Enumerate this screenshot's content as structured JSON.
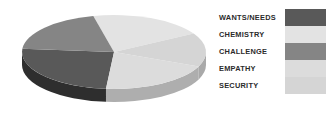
{
  "chart_data": {
    "type": "pie",
    "title": "",
    "subtitle": "",
    "xlabel": "",
    "ylabel": "",
    "legend_position": "right",
    "grid": false,
    "three_d": true,
    "background_color": "#ffffff",
    "categories": [
      "WANTS/NEEDS",
      "CHEMISTRY",
      "CHALLENGE",
      "EMPATHY",
      "SECURITY"
    ],
    "values": [
      25,
      20,
      20,
      20,
      15
    ],
    "colors": [
      "#595959",
      "#e3e3e3",
      "#858585",
      "#dcdcdc",
      "#d5d5d5"
    ],
    "side_colors": [
      "#2e2e2e",
      "#b4b4b4",
      "#5f5f5f",
      "#aeaeae",
      "#a9a9a9"
    ],
    "slices": [
      {
        "label": "WANTS/NEEDS",
        "value": 25,
        "color": "#595959",
        "side_color": "#2e2e2e",
        "start_angle": 95,
        "end_angle": 185
      },
      {
        "label": "CHEMISTRY",
        "value": 20,
        "color": "#e3e3e3",
        "side_color": "#b4b4b4",
        "start_angle": 257,
        "end_angle": 330
      },
      {
        "label": "CHALLENGE",
        "value": 20,
        "color": "#858585",
        "side_color": "#5f5f5f",
        "start_angle": 185,
        "end_angle": 257
      },
      {
        "label": "EMPATHY",
        "value": 20,
        "color": "#dcdcdc",
        "side_color": "#aeaeae",
        "start_angle": 23,
        "end_angle": 95
      },
      {
        "label": "SECURITY",
        "value": 15,
        "color": "#d5d5d5",
        "side_color": "#a9a9a9",
        "start_angle": 330,
        "end_angle": 23
      }
    ]
  },
  "legend": {
    "items": [
      {
        "label": "WANTS/NEEDS",
        "color": "#595959"
      },
      {
        "label": "CHEMISTRY",
        "color": "#e3e3e3"
      },
      {
        "label": "CHALLENGE",
        "color": "#858585"
      },
      {
        "label": "EMPATHY",
        "color": "#dcdcdc"
      },
      {
        "label": "SECURITY",
        "color": "#d5d5d5"
      }
    ]
  }
}
